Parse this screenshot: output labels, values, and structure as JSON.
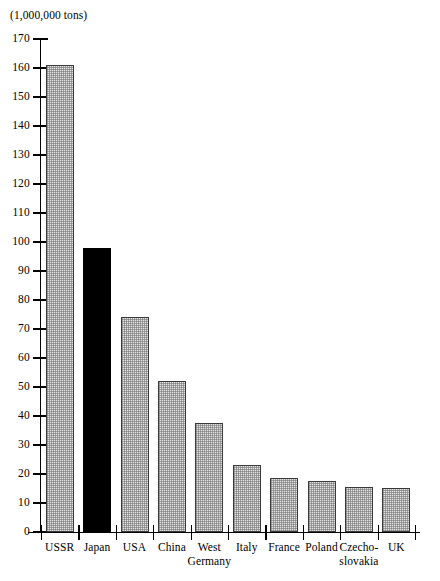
{
  "caption": "(1,000,000 tons)",
  "chart_data": {
    "type": "bar",
    "title": "",
    "subtitle": "",
    "unit_caption": "(1,000,000 tons)",
    "xlabel": "",
    "ylabel": "(1,000,000 tons)",
    "ylim": [
      0,
      170
    ],
    "y_tick_step": 10,
    "grid": false,
    "legend": "none",
    "categories": [
      "USSR",
      "Japan",
      "USA",
      "China",
      "West\nGermany",
      "Italy",
      "France",
      "Poland",
      "Czecho-\nslovakia",
      "UK"
    ],
    "values": [
      161,
      98,
      74,
      52,
      37.5,
      23,
      18.5,
      17.5,
      15.5,
      15.2
    ],
    "y_ticks": [
      0,
      10,
      20,
      30,
      40,
      50,
      60,
      70,
      80,
      90,
      100,
      110,
      120,
      130,
      140,
      150,
      160,
      170
    ],
    "y_tick_labels": [
      "0",
      "10",
      "20",
      "30",
      "40",
      "50",
      "60",
      "70",
      "80",
      "90",
      "100",
      "110",
      "120",
      "130",
      "140",
      "150",
      "160",
      "170"
    ],
    "bar_styles": [
      "hatched",
      "solid-black",
      "hatched",
      "hatched",
      "hatched",
      "hatched",
      "hatched",
      "hatched",
      "hatched",
      "hatched"
    ],
    "highlighted_category": "Japan",
    "colors": {
      "bar_fill": "#e2e2e2",
      "bar_stipple": "#6e6e6e",
      "bar_border": "#3a3a3a",
      "highlight_fill": "#000000",
      "axis": "#000000",
      "background": "#ffffff"
    }
  }
}
